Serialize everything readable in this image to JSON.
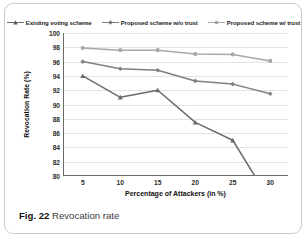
{
  "figure": {
    "caption_label": "Fig. 22",
    "caption_text": "Revocation rate"
  },
  "chart_data": {
    "type": "line",
    "title": "",
    "xlabel": "Percentage of Attackers (in %)",
    "ylabel": "Revocation Rate (%)",
    "x": [
      5,
      10,
      15,
      20,
      25,
      30
    ],
    "xtick_labels": [
      "5",
      "10",
      "15",
      "20",
      "25",
      "30"
    ],
    "ytick_labels": [
      "80",
      "82",
      "84",
      "86",
      "88",
      "90",
      "92",
      "94",
      "96",
      "98",
      "100"
    ],
    "xlim": [
      2.5,
      32.5
    ],
    "ylim": [
      80,
      100
    ],
    "grid": true,
    "grid_axis": "y",
    "legend_position": "top-center",
    "series": [
      {
        "name": "Existing voting scheme",
        "color": "#6b6b6b",
        "marker": "triangle",
        "values": [
          94.0,
          91.0,
          92.0,
          87.5,
          85.0,
          76.5
        ],
        "clipped_below_axis": true
      },
      {
        "name": "Proposed scheme w/o trust",
        "color": "#7f7f7f",
        "marker": "diamond",
        "values": [
          96.0,
          95.0,
          94.8,
          93.3,
          92.85,
          91.5
        ]
      },
      {
        "name": "Proposed scheme w/ trust",
        "color": "#a8a8a8",
        "marker": "circle",
        "values": [
          97.9,
          97.6,
          97.6,
          97.05,
          97.0,
          96.1
        ]
      }
    ]
  }
}
